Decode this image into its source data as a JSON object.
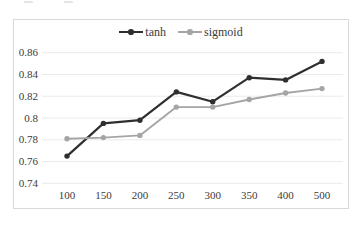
{
  "chart_data": {
    "type": "line",
    "title": "",
    "xlabel": "",
    "ylabel": "",
    "categories": [
      "100",
      "150",
      "200",
      "250",
      "300",
      "350",
      "400",
      "500"
    ],
    "series": [
      {
        "name": "tanh",
        "color": "#2f2f2f",
        "values": [
          0.765,
          0.795,
          0.798,
          0.824,
          0.815,
          0.837,
          0.835,
          0.852
        ]
      },
      {
        "name": "sigmoid",
        "color": "#a5a5a5",
        "values": [
          0.781,
          0.782,
          0.784,
          0.81,
          0.81,
          0.817,
          0.823,
          0.827
        ]
      }
    ],
    "ylim": [
      0.74,
      0.86
    ],
    "y_ticks": [
      {
        "label": "0.86",
        "value": 0.86
      },
      {
        "label": "0.84",
        "value": 0.84
      },
      {
        "label": "0.82",
        "value": 0.82
      },
      {
        "label": "0.8",
        "value": 0.8
      },
      {
        "label": "0.78",
        "value": 0.78
      },
      {
        "label": "0.76",
        "value": 0.76
      },
      {
        "label": "0.74",
        "value": 0.74
      }
    ],
    "grid": "horizontal-only",
    "legend_position": "top-center"
  },
  "colors": {
    "background": "#ffffff",
    "frame_border": "#d9d9d9",
    "gridline": "#eaeaea",
    "text": "#3b3b3b"
  }
}
